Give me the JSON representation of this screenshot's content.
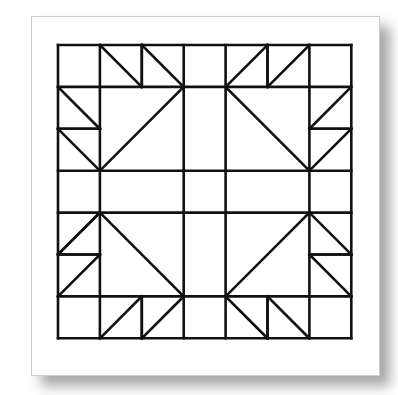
{
  "diagram": {
    "type": "quilt-block",
    "grid": {
      "rows": 7,
      "cols": 7,
      "origin": [
        58,
        45
      ],
      "cell": 41.9
    },
    "colors": {
      "line": "#111111",
      "card": "#ffffff",
      "card_border": "#cfcfcf",
      "background": "#ffffff"
    },
    "stroke_width": 2.6,
    "grid_lines": {
      "vertical_full": [
        0,
        1,
        3,
        4,
        6,
        7
      ],
      "horizontal_full": [
        0,
        1,
        3,
        4,
        6,
        7
      ],
      "vertical_partial": [
        [
          2,
          0,
          1
        ],
        [
          5,
          0,
          1
        ],
        [
          2,
          6,
          7
        ],
        [
          5,
          6,
          7
        ]
      ],
      "horizontal_partial": [
        [
          2,
          0,
          1
        ],
        [
          5,
          0,
          1
        ],
        [
          2,
          6,
          7
        ],
        [
          5,
          6,
          7
        ]
      ]
    },
    "diagonals": [
      [
        1,
        0,
        2,
        1
      ],
      [
        2,
        0,
        3,
        1
      ],
      [
        0,
        1,
        1,
        2
      ],
      [
        0,
        2,
        1,
        3
      ],
      [
        3,
        1,
        1,
        3
      ],
      [
        6,
        0,
        5,
        1
      ],
      [
        5,
        0,
        4,
        1
      ],
      [
        7,
        1,
        6,
        2
      ],
      [
        7,
        2,
        6,
        3
      ],
      [
        4,
        1,
        6,
        3
      ],
      [
        1,
        4,
        0,
        5
      ],
      [
        1,
        4,
        0,
        5
      ],
      [
        1,
        5,
        0,
        6
      ],
      [
        1,
        4,
        3,
        6
      ],
      [
        1,
        7,
        2,
        6
      ],
      [
        2,
        7,
        3,
        6
      ],
      [
        6,
        4,
        7,
        5
      ],
      [
        6,
        5,
        7,
        6
      ],
      [
        6,
        4,
        4,
        6
      ],
      [
        4,
        6,
        5,
        7
      ],
      [
        5,
        6,
        6,
        7
      ]
    ]
  }
}
